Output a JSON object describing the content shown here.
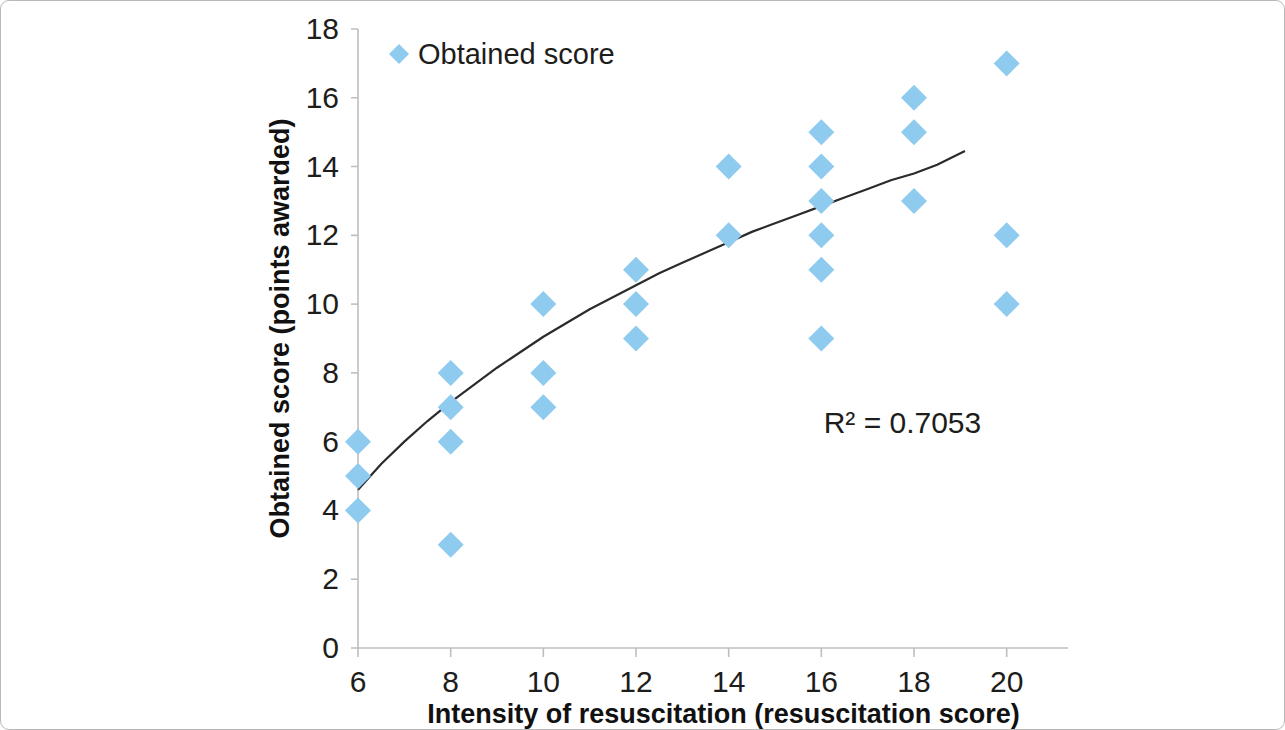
{
  "chart_data": {
    "type": "scatter",
    "title": "",
    "xlabel": "Intensity of resuscitation (resuscitation score)",
    "ylabel": "Obtained score (points awarded)",
    "xlim": [
      6,
      21
    ],
    "ylim": [
      0,
      18
    ],
    "xticks": [
      6,
      8,
      10,
      12,
      14,
      16,
      18,
      20
    ],
    "yticks": [
      0,
      2,
      4,
      6,
      8,
      10,
      12,
      14,
      16,
      18
    ],
    "xtick_labels": [
      "6",
      "8",
      "10",
      "12",
      "14",
      "16",
      "18",
      "20"
    ],
    "ytick_labels": [
      "0",
      "2",
      "4",
      "6",
      "8",
      "10",
      "12",
      "14",
      "16",
      "18"
    ],
    "grid": false,
    "legend_position": "top-left",
    "series": [
      {
        "name": "Obtained score",
        "marker": "diamond",
        "color": "#8ecbef",
        "points": [
          {
            "x": 6,
            "y": 6
          },
          {
            "x": 6,
            "y": 5
          },
          {
            "x": 6,
            "y": 4
          },
          {
            "x": 8,
            "y": 8
          },
          {
            "x": 8,
            "y": 7
          },
          {
            "x": 8,
            "y": 6
          },
          {
            "x": 8,
            "y": 3
          },
          {
            "x": 10,
            "y": 10
          },
          {
            "x": 10,
            "y": 8
          },
          {
            "x": 10,
            "y": 7
          },
          {
            "x": 12,
            "y": 11
          },
          {
            "x": 12,
            "y": 10
          },
          {
            "x": 12,
            "y": 9
          },
          {
            "x": 14,
            "y": 14
          },
          {
            "x": 14,
            "y": 12
          },
          {
            "x": 16,
            "y": 15
          },
          {
            "x": 16,
            "y": 14
          },
          {
            "x": 16,
            "y": 13
          },
          {
            "x": 16,
            "y": 12
          },
          {
            "x": 16,
            "y": 11
          },
          {
            "x": 16,
            "y": 9
          },
          {
            "x": 18,
            "y": 16
          },
          {
            "x": 18,
            "y": 15
          },
          {
            "x": 18,
            "y": 13
          },
          {
            "x": 20,
            "y": 17
          },
          {
            "x": 20,
            "y": 12
          },
          {
            "x": 20,
            "y": 10
          }
        ]
      }
    ],
    "trendline": {
      "type": "logarithmic",
      "color": "#2b2b2b",
      "r_squared_label": "R² = 0.7053",
      "r_squared_value": 0.7053,
      "x_start": 6,
      "x_end": 19.1,
      "points": [
        {
          "x": 6.0,
          "y": 4.6
        },
        {
          "x": 6.5,
          "y": 5.35
        },
        {
          "x": 7.0,
          "y": 6.0
        },
        {
          "x": 7.5,
          "y": 6.6
        },
        {
          "x": 8.0,
          "y": 7.15
        },
        {
          "x": 8.5,
          "y": 7.65
        },
        {
          "x": 9.0,
          "y": 8.15
        },
        {
          "x": 9.5,
          "y": 8.6
        },
        {
          "x": 10.0,
          "y": 9.05
        },
        {
          "x": 10.5,
          "y": 9.45
        },
        {
          "x": 11.0,
          "y": 9.85
        },
        {
          "x": 11.5,
          "y": 10.2
        },
        {
          "x": 12.0,
          "y": 10.55
        },
        {
          "x": 12.5,
          "y": 10.9
        },
        {
          "x": 13.0,
          "y": 11.2
        },
        {
          "x": 13.5,
          "y": 11.5
        },
        {
          "x": 14.0,
          "y": 11.8
        },
        {
          "x": 14.5,
          "y": 12.1
        },
        {
          "x": 15.0,
          "y": 12.35
        },
        {
          "x": 15.5,
          "y": 12.6
        },
        {
          "x": 16.0,
          "y": 12.85
        },
        {
          "x": 16.5,
          "y": 13.1
        },
        {
          "x": 17.0,
          "y": 13.35
        },
        {
          "x": 17.5,
          "y": 13.6
        },
        {
          "x": 18.0,
          "y": 13.8
        },
        {
          "x": 18.5,
          "y": 14.05
        },
        {
          "x": 19.1,
          "y": 14.45
        }
      ]
    },
    "legend": [
      {
        "label": "Obtained score",
        "color": "#8ecbef",
        "marker": "diamond"
      }
    ],
    "annotations": [
      {
        "text": "R² = 0.7053",
        "x": 16.05,
        "y": 6.25
      }
    ]
  }
}
